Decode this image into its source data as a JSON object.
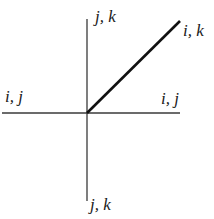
{
  "diagram": {
    "labels": {
      "top": "j, k",
      "upper_right": "i, k",
      "left": "i, j",
      "right": "i, j",
      "bottom": "j, k"
    },
    "colors": {
      "line": "#3a3a3a",
      "diagonal": "#111111",
      "text": "#1a1a1a"
    }
  }
}
